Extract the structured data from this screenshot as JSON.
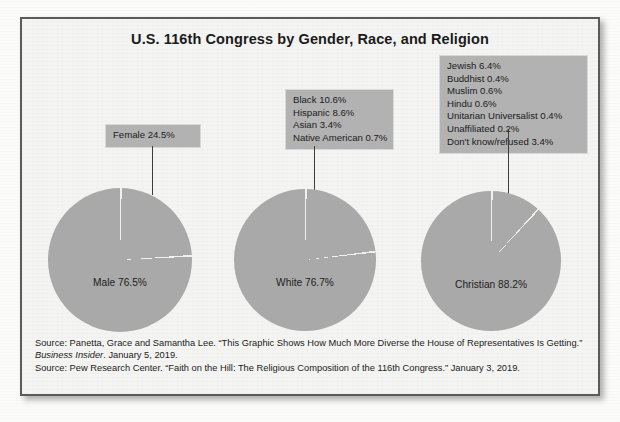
{
  "figure": {
    "title": "U.S. 116th Congress by Gender, Race, and Religion",
    "pie_fill_color": "#a9a9a9",
    "callout_fill_color": "#b2b2b2",
    "frame_border_color": "#5b5b5b",
    "background_color": "#f4f4f2"
  },
  "callouts": {
    "gender": {
      "lines": [
        "Female 24.5%"
      ]
    },
    "race": {
      "lines": [
        "Black 10.6%",
        "Hispanic 8.6%",
        "Asian 3.4%",
        "Native American 0.7%"
      ]
    },
    "religion": {
      "lines": [
        "Jewish 6.4%",
        "Buddhist 0.4%",
        "Muslim 0.6%",
        "Hindu 0.6%",
        "Unitarian Universalist 0.4%",
        "Unaffiliated 0.2%",
        "Don't know/refused 3.4%"
      ]
    }
  },
  "pie_labels": {
    "gender": "Male 76.5%",
    "race": "White 76.7%",
    "religion": "Christian 88.2%"
  },
  "sources": {
    "line1_pre": "Source: Panetta, Grace and Samantha Lee. “This Graphic Shows How Much More Diverse the House of Representatives Is Getting.”",
    "line2_italic": "Business Insider",
    "line2_post": ". January 5, 2019.",
    "line3": "Source: Pew Research Center. “Faith on the Hill: The Religious Composition of the 116th Congress.” January 3, 2019."
  },
  "chart_data": [
    {
      "type": "pie",
      "title": "Gender",
      "categories": [
        "Male",
        "Female"
      ],
      "values": [
        76.5,
        24.5
      ],
      "labels": [
        "Male 76.5%",
        "Female 24.5%"
      ],
      "unit": "%",
      "start_angle_deg": 0,
      "direction": "clockwise",
      "legend_position": "callout-above-left"
    },
    {
      "type": "pie",
      "title": "Race",
      "categories": [
        "White",
        "Black",
        "Hispanic",
        "Asian",
        "Native American"
      ],
      "values": [
        76.7,
        10.6,
        8.6,
        3.4,
        0.7
      ],
      "labels": [
        "White 76.7%",
        "Black 10.6%",
        "Hispanic 8.6%",
        "Asian 3.4%",
        "Native American 0.7%"
      ],
      "unit": "%",
      "start_angle_deg": 0,
      "direction": "clockwise",
      "legend_position": "callout-above-center"
    },
    {
      "type": "pie",
      "title": "Religion",
      "categories": [
        "Christian",
        "Jewish",
        "Buddhist",
        "Muslim",
        "Hindu",
        "Unitarian Universalist",
        "Unaffiliated",
        "Don't know/refused"
      ],
      "values": [
        88.2,
        6.4,
        0.4,
        0.6,
        0.6,
        0.4,
        0.2,
        3.4
      ],
      "labels": [
        "Christian 88.2%",
        "Jewish 6.4%",
        "Buddhist 0.4%",
        "Muslim 0.6%",
        "Hindu 0.6%",
        "Unitarian Universalist 0.4%",
        "Unaffiliated 0.2%",
        "Don't know/refused 3.4%"
      ],
      "unit": "%",
      "start_angle_deg": 0,
      "direction": "clockwise",
      "legend_position": "callout-above-right"
    }
  ]
}
